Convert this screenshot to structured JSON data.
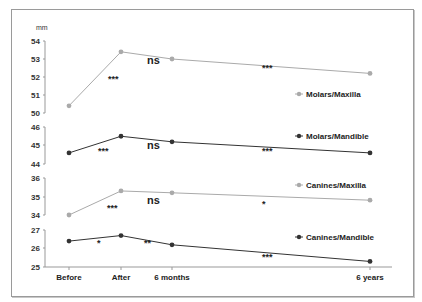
{
  "chart_data": {
    "type": "line",
    "title": "",
    "ylabel": "mm",
    "xlabel": "",
    "categories": [
      "Before",
      "After",
      "6 months",
      "6 years"
    ],
    "x_positions": [
      69,
      121,
      172,
      370
    ],
    "grid": false,
    "legend_position": "right, inline next to each series",
    "panels": [
      {
        "name": "Molars/Maxilla",
        "ylim": [
          50,
          54
        ],
        "ticks": [
          54,
          53,
          52,
          51,
          50
        ],
        "tick_y": [
          41,
          59,
          77,
          95,
          113
        ],
        "color": "#aaaaaa",
        "values": [
          50.4,
          53.4,
          53.0,
          52.2
        ],
        "significance": [
          "***",
          "ns",
          "***"
        ]
      },
      {
        "name": "Molars/Mandible",
        "ylim": [
          44,
          46
        ],
        "ticks": [
          46,
          45,
          44
        ],
        "tick_y": [
          127,
          145,
          164
        ],
        "color": "#333333",
        "values": [
          44.6,
          45.5,
          45.2,
          44.6
        ],
        "significance": [
          "***",
          "ns",
          "***"
        ]
      },
      {
        "name": "Canines/Maxilla",
        "ylim": [
          34,
          36
        ],
        "ticks": [
          36,
          35,
          34
        ],
        "tick_y": [
          178,
          197,
          215
        ],
        "color": "#aaaaaa",
        "values": [
          34.0,
          35.3,
          35.2,
          34.8
        ],
        "significance": [
          "***",
          "ns",
          "*"
        ]
      },
      {
        "name": "Canines/Mandible",
        "ylim": [
          25,
          27
        ],
        "ticks": [
          27,
          26,
          25
        ],
        "tick_y": [
          230,
          248,
          267
        ],
        "color": "#333333",
        "values": [
          26.4,
          26.7,
          26.2,
          25.3
        ],
        "significance": [
          "*",
          "**",
          "***"
        ]
      }
    ],
    "series": [
      {
        "name": "Molars/Maxilla",
        "values": [
          50.4,
          53.4,
          53.0,
          52.2
        ]
      },
      {
        "name": "Molars/Mandible",
        "values": [
          44.6,
          45.5,
          45.2,
          44.6
        ]
      },
      {
        "name": "Canines/Maxilla",
        "values": [
          34.0,
          35.3,
          35.2,
          34.8
        ]
      },
      {
        "name": "Canines/Mandible",
        "values": [
          26.4,
          26.7,
          26.2,
          25.3
        ]
      }
    ],
    "annotations": [
      {
        "text": "***",
        "x": 108,
        "y": 82
      },
      {
        "text": "ns",
        "x": 147,
        "y": 64
      },
      {
        "text": "***",
        "x": 262,
        "y": 71
      },
      {
        "text": "***",
        "x": 98,
        "y": 154
      },
      {
        "text": "ns",
        "x": 147,
        "y": 149
      },
      {
        "text": "***",
        "x": 262,
        "y": 154
      },
      {
        "text": "***",
        "x": 107,
        "y": 211
      },
      {
        "text": "ns",
        "x": 147,
        "y": 204
      },
      {
        "text": "*",
        "x": 262,
        "y": 207
      },
      {
        "text": "*",
        "x": 97,
        "y": 246
      },
      {
        "text": "**",
        "x": 144,
        "y": 246
      },
      {
        "text": "***",
        "x": 262,
        "y": 260
      }
    ],
    "legend": [
      {
        "label": "Molars/Maxilla",
        "x": 306,
        "y": 97
      },
      {
        "label": "Molars/Mandible",
        "x": 306,
        "y": 139
      },
      {
        "label": "Canines/Maxilla",
        "x": 306,
        "y": 188
      },
      {
        "label": "Canines/Mandible",
        "x": 306,
        "y": 240
      }
    ]
  }
}
